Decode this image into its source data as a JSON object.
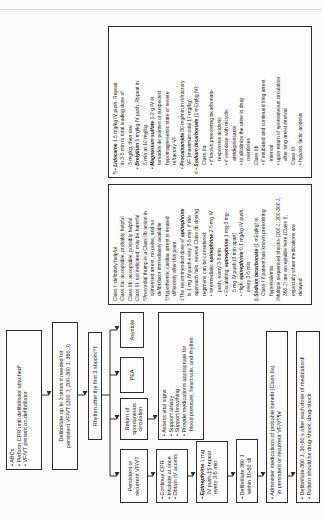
{
  "figure": {
    "accent_ink": "#2b2b2b",
    "paper": "#fbfbf9",
    "flow": {
      "abcs": {
        "lines": [
          "• ABCs",
          "• Perform CPR until defibrillator attached*",
          "• VF/VT present on defibrillator"
        ]
      },
      "defibrillate3": {
        "lines": [
          "Defibrillate up to 3 times if needed for",
          "persistent VF/VT (200 J, 200-300 J, 360 J)"
        ]
      },
      "rhythm": {
        "label": "Rhythm after the first 3 shocks?†"
      },
      "branches": {
        "vfvt": {
          "lines": [
            "Persistent or",
            "recurrent VF/VT"
          ]
        },
        "rosc": {
          "lines": [
            "Return of",
            "spontaneous",
            "circulation"
          ]
        },
        "pea": {
          "label": "PEA"
        },
        "asystole": {
          "label": "Asystole"
        }
      },
      "rosc_care": {
        "lines": [
          "• Assess vital signs",
          "• Support airway",
          "• Support breathing",
          "• Provide medications appropriate for",
          {
            "i": 1,
            "t": "blood pressure, heart rate, and rhythm"
          }
        ]
      },
      "continue_cpr": {
        "lines": [
          "• Continue CPR",
          "• Intubate at once",
          "• Obtain IV access"
        ]
      },
      "epinephrine": {
        "lines": [
          "• **Epinephrine** 1 mg",
          {
            "i": 1,
            "t": "IV push,‡§ repeat"
          },
          {
            "i": 1,
            "t": "every 3-5 min"
          }
        ]
      },
      "defib_360": {
        "lines": [
          "• Defibrillate 360 J",
          {
            "i": 1,
            "t": "within 30-60 s‖"
          }
        ]
      },
      "admin_meds": {
        "lines": [
          "• Administer medications of probable benefit (Class IIa)",
          {
            "i": 1,
            "t": "in persistent or recurrent VF/VT¶#"
          }
        ]
      },
      "drug_shock": {
        "lines": [
          "• Defibrillate 360 J, 30-60 s after each dose of medication‖",
          "• Pattern should be drug-shock, drug-shock"
        ]
      }
    },
    "notes_class": {
      "lines": [
        "Class I: definitely helpful",
        "Class IIa: acceptable, probably helpful",
        "Class IIb: acceptable, possibly helpful",
        "Class III: not indicated, may be harmful",
        "*Precordial thump is a Class IIb action in",
        {
          "i": 1,
          "t": "witnessed arrest, no pulse, and no"
        },
        {
          "i": 1,
          "t": "defibrillator immediately available"
        },
        "†Hypothermic cardiac arrest is treated",
        {
          "i": 1,
          "t": "differently after this point."
        },
        "‡The recommended dose of **epinephrine**",
        {
          "i": 1,
          "t": "is 1 mg IV push every 3-5 min. If this"
        },
        {
          "i": 1,
          "t": "approach fails, several Class IIb dosing"
        },
        {
          "i": 1,
          "t": "regimens can be considered:"
        },
        {
          "i": 1,
          "t": "• Intermediate: **epinephrine** 2-5 mg IV"
        },
        {
          "i": 2,
          "t": "push, every 3-5 min"
        },
        {
          "i": 1,
          "t": "• Escalating: **epinephrine** 1 mg-3 mg-"
        },
        {
          "i": 2,
          "t": "5 mg IV push (3 min apart)"
        },
        {
          "i": 1,
          "t": "• High: **epinephrine** 0.1 mg/kg IV push,"
        },
        {
          "i": 2,
          "t": "every 3-5 min"
        },
        "§ **Sodium bicarbonate** (1 mEq/kg) is",
        {
          "i": 1,
          "t": "Class I if patient has known preexisting"
        },
        {
          "i": 1,
          "t": "hyperkalemia"
        },
        "‖Multiple sequenced shocks (200 J, 200-300 J,",
        {
          "i": 1,
          "t": "360 J) are acceptable here (Class I),"
        },
        {
          "i": 1,
          "t": "especially when medications are"
        },
        {
          "i": 1,
          "t": "delayed"
        }
      ]
    },
    "notes_drugs": {
      "lines": [
        "¶ • **Lidocaine** 1.5 mg/kg IV push. Repeat",
        {
          "i": 2,
          "t": "in 3-5 min to total loading dose of"
        },
        {
          "i": 2,
          "t": "3 mg/kg, then use"
        },
        {
          "i": 1,
          "t": "• **Bretylium** 5 mg/kg IV push. Repeat in"
        },
        {
          "i": 2,
          "t": "5 min at 10 mg/kg"
        },
        {
          "i": 1,
          "t": "• **Magnesium sulfate** 1-2 g IV in"
        },
        {
          "i": 2,
          "t": "torsades de pointes or suspected"
        },
        {
          "i": 2,
          "t": "hypomagnesemic state or severe"
        },
        {
          "i": 2,
          "t": "refractory VF"
        },
        {
          "i": 1,
          "t": "• **Procainamide** 30 mg/min in refractory"
        },
        {
          "i": 2,
          "t": "VF (maximum total 17 mg/kg)"
        },
        "# • **Sodium bicarbonate** (1 mEq/kg IV):",
        {
          "i": 2,
          "t": "Class IIa"
        },
        {
          "i": 2,
          "t": "• if known preexisting bicarbonate-"
        },
        {
          "i": 3,
          "t": "responsive acidosis"
        },
        {
          "i": 2,
          "t": "• if overdose with tricyclic"
        },
        {
          "i": 3,
          "t": "antidepressants"
        },
        {
          "i": 2,
          "t": "• to alkalinize the urine in drug"
        },
        {
          "i": 3,
          "t": "overdoses"
        },
        {
          "i": 2,
          "t": "Class IIb"
        },
        {
          "i": 2,
          "t": "• if intubated and continued long arrest"
        },
        {
          "i": 3,
          "t": "interval"
        },
        {
          "i": 2,
          "t": "• upon return of spontaneous circulation"
        },
        {
          "i": 3,
          "t": "after long arrest interval"
        },
        {
          "i": 2,
          "t": "Class III"
        },
        {
          "i": 2,
          "t": "• hypoxic lactic acidosis"
        }
      ]
    }
  }
}
